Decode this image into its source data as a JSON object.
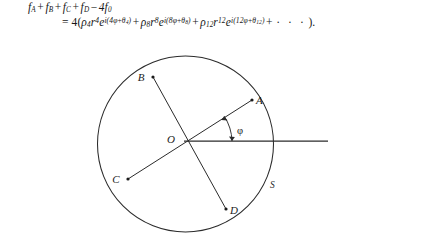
{
  "equation": {
    "line1": {
      "terms": [
        "f",
        "A",
        "+",
        "f",
        "B",
        "+",
        "f",
        "C",
        "+",
        "f",
        "D",
        "−",
        "4f",
        "0"
      ],
      "plain": "f_A + f_B + f_C + f_D − 4f_0",
      "f": "f",
      "sub_A": "A",
      "sub_B": "B",
      "sub_C": "C",
      "sub_D": "D",
      "coefficient": "4f",
      "sub_zero": "0",
      "plus": "+",
      "minus": "−"
    },
    "line2": {
      "plain": "= 4(ρ₄r⁴e^{i(4φ+θ₄)} + ρ₈r⁸e^{i(8φ+θ₈)} + ρ₁₂r¹²e^{i(12φ+θ₁₂)} + · · ·).",
      "equals": "=",
      "prefactor": "4(",
      "rho": "ρ",
      "r": "r",
      "e": "e",
      "i": "i",
      "phi": "φ",
      "theta": "θ",
      "plus": "+",
      "open_paren": "(",
      "close_paren": ")",
      "term1": {
        "rho_sub": "4",
        "r_exp": "4",
        "phase_coeff": "4",
        "theta_sub": "4"
      },
      "term2": {
        "rho_sub": "8",
        "r_exp": "8",
        "phase_coeff": "8",
        "theta_sub": "8"
      },
      "term3": {
        "rho_sub": "12",
        "r_exp": "12",
        "phase_coeff": "12",
        "theta_sub": "12"
      },
      "ellipsis": "· · ·",
      "tail": ").",
      "close_period": "."
    }
  },
  "diagram": {
    "labels": {
      "center": "O",
      "point_a": "A",
      "point_b": "B",
      "point_c": "C",
      "point_d": "D",
      "circle": "S",
      "angle": "φ"
    },
    "geometry": {
      "circle_center_x": 185.5,
      "circle_center_y": 98.0,
      "circle_radius": 88.0,
      "origin_x": 184.0,
      "origin_y": 95.0,
      "point_a_x": 252.0,
      "point_a_y": 54.0,
      "point_b_x": 153.0,
      "point_b_y": 31.0,
      "point_c_x": 128.0,
      "point_c_y": 133.0,
      "point_d_x": 226.0,
      "point_d_y": 163.0,
      "axis_end_x": 328.0,
      "axis_end_y": 95.0,
      "arc_radius": 48.0
    },
    "colors": {
      "stroke": "#2b2b2b",
      "text": "#1b1b1b",
      "background": "#ffffff"
    }
  }
}
